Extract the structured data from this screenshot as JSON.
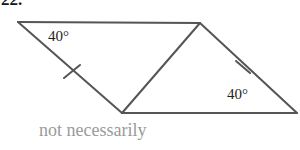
{
  "problem": {
    "number": "22."
  },
  "figure": {
    "name": "parallelogram-with-diagonal",
    "stroke_color": "#555555",
    "stroke_width": 2,
    "vertices": {
      "top_left": {
        "label": "A",
        "x": 18,
        "y": 22
      },
      "top_right": {
        "label": "B",
        "x": 200,
        "y": 23
      },
      "bottom_left": {
        "label": "C",
        "x": 122,
        "y": 113
      },
      "bottom_right": {
        "label": "D",
        "x": 297,
        "y": 113
      }
    },
    "edges": [
      {
        "name": "top-edge",
        "from": "A",
        "to": "B"
      },
      {
        "name": "left-edge",
        "from": "A",
        "to": "C"
      },
      {
        "name": "bottom-edge",
        "from": "C",
        "to": "D"
      },
      {
        "name": "right-edge",
        "from": "B",
        "to": "D"
      },
      {
        "name": "diagonal",
        "from": "C",
        "to": "B"
      }
    ],
    "tick_marks": [
      {
        "name": "tick-left-edge",
        "on_edge": "left-edge",
        "x": 72,
        "y": 72
      },
      {
        "name": "tick-right-edge",
        "on_edge": "right-edge",
        "x": 243,
        "y": 67
      }
    ],
    "angle_labels": [
      {
        "name": "angle-upper-left",
        "text": "40°",
        "x": 48,
        "y": 29
      },
      {
        "name": "angle-lower-right",
        "text": "40°",
        "x": 227,
        "y": 87
      }
    ]
  },
  "caption": {
    "text": "not necessarily",
    "color": "#9a9a9a"
  }
}
